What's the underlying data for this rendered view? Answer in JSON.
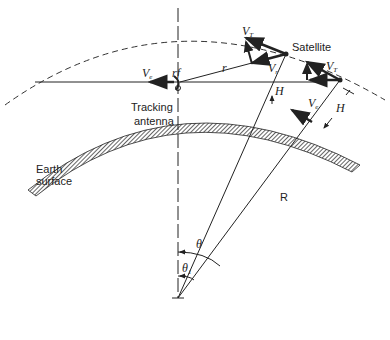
{
  "diagram": {
    "labels": {
      "satellite": "Satellite",
      "tracking_antenna_line1": "Tracking",
      "tracking_antenna_line2": "antenna",
      "earth_surface_line1": "Earth",
      "earth_surface_line2": "surface",
      "rf": "rf",
      "r": "r",
      "R": "R",
      "H": "H",
      "theta": "θ",
      "theta1": "θ",
      "theta1_sub": "1",
      "V": "V",
      "sub_T": "T",
      "sub_r": "r",
      "sub_e": "e"
    },
    "colors": {
      "ink": "#222222",
      "background": "#ffffff"
    }
  }
}
